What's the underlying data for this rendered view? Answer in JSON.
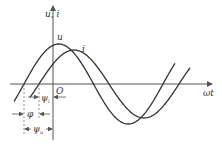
{
  "diagram": {
    "title": "",
    "y_axis_label": "u, i",
    "x_axis_label": "ωt",
    "origin_label": "O",
    "curves": [
      {
        "name": "u",
        "label": "u",
        "amplitude_px": 40,
        "zero_cross_x": 24,
        "peak_x": 58
      },
      {
        "name": "i",
        "label": "i",
        "amplitude_px": 34,
        "zero_cross_x": 39,
        "peak_x": 75
      }
    ],
    "annotations": {
      "psi_i": "ψ",
      "psi_i_sub": "i",
      "phi": "φ",
      "psi_u": "ψ",
      "psi_u_sub": "u"
    },
    "colors": {
      "line": "#333333",
      "axis": "#555555",
      "dashed": "#777777"
    }
  }
}
